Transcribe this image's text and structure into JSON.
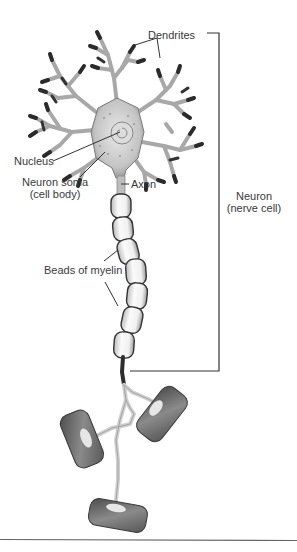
{
  "diagram": {
    "labels": {
      "dendrites": "Dendrites",
      "nucleus": "Nucleus",
      "soma_line1": "Neuron soma",
      "soma_line2": "(cell body)",
      "axon": "Axon",
      "myelin": "Beads of myelin",
      "neuron_line1": "Neuron",
      "neuron_line2": "(nerve cell)"
    },
    "parts": [
      "dendrites",
      "nucleus",
      "soma",
      "axon",
      "myelin-beads",
      "axon-terminals"
    ],
    "myelin_bead_count": 7,
    "axon_terminal_count": 3,
    "colors": {
      "line": "#333333",
      "dendrite_dark": "#2a2a2a",
      "dendrite_light": "#d8d8d8",
      "soma_fill": "#cfcfcf",
      "bead_fill": "#f3f3f3",
      "terminal_fill": "#6e6e6e",
      "rule": "#555555"
    }
  }
}
